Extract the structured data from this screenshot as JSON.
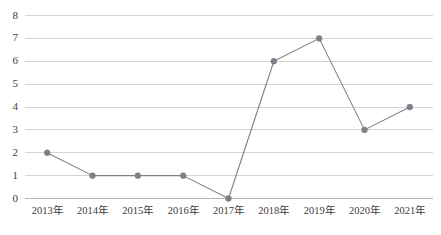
{
  "chart_data": {
    "type": "line",
    "title": "",
    "subtitle": "",
    "xlabel": "",
    "ylabel": "",
    "categories": [
      "2013年",
      "2014年",
      "2015年",
      "2016年",
      "2017年",
      "2018年",
      "2019年",
      "2020年",
      "2021年"
    ],
    "values": [
      2,
      1,
      1,
      1,
      0,
      6,
      7,
      3,
      4
    ],
    "series": [
      {
        "name": "",
        "values": [
          2,
          1,
          1,
          1,
          0,
          6,
          7,
          3,
          4
        ]
      }
    ],
    "ylim": [
      0,
      8
    ],
    "ytick_labels": [
      "0",
      "1",
      "2",
      "3",
      "4",
      "5",
      "6",
      "7",
      "8"
    ],
    "ytick_values": [
      0,
      1,
      2,
      3,
      4,
      5,
      6,
      7,
      8
    ],
    "grid": true,
    "grid_axis": "y",
    "legend": false,
    "legend_position": "none",
    "marker": "circle",
    "colors": {
      "line": "#808080",
      "marker": "#7f7f8c",
      "grid": "#d4d4d4",
      "axis": "#b5b5b5",
      "text": "#3b3b3b",
      "background": "#ffffff"
    }
  }
}
